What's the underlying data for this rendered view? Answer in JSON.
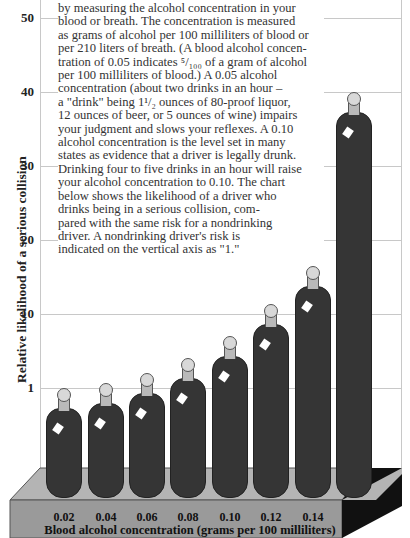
{
  "chart_data": {
    "type": "bar",
    "title": "",
    "xlabel": "Blood alcohol concentration (grams per 100 milliliters)",
    "ylabel": "Relative likelihood of a serious collision",
    "categories": [
      "0.02",
      "0.04",
      "0.06",
      "0.08",
      "0.10",
      "0.12",
      "0.14",
      "0.16"
    ],
    "values": [
      1,
      1.3,
      2,
      3,
      6,
      10,
      25,
      50
    ],
    "ytick_labels": [
      "1",
      "10",
      "20",
      "30",
      "40",
      "50"
    ],
    "grid": true,
    "marker_style": "wine bottles",
    "note": "Y-axis is non-linear; 1 = nondrinking driver's risk"
  },
  "text_block": {
    "lines": [
      "by measuring the alcohol concentration in your",
      "blood or breath. The concentration is measured",
      "as grams of alcohol per 100 milliliters of blood or",
      "per 210 liters of breath. (A blood alcohol concen-",
      "tration of 0.05 indicates ⁵/₁₀₀ of a gram of alcohol",
      "per 100 milliliters of blood.) A 0.05 alcohol",
      "concentration (about two drinks in an hour –",
      " a \"drink\" being 1¹/₂ ounces of 80-proof liquor,",
      "12 ounces of beer, or 5 ounces of wine) impairs",
      "your judgment and slows your reflexes. A 0.10",
      "alcohol concentration is the level set in many",
      "states as evidence that a driver is legally drunk.",
      "Drinking four to five drinks in an hour will raise",
      "your alcohol concentration to 0.10. The chart",
      "below shows the likelihood of a driver who",
      "drinks being in a serious collision, com-",
      "pared with the same risk for a nondrinking",
      "driver. A nondrinking driver's risk is",
      "indicated on the vertical axis as \"1.\""
    ]
  },
  "axis": {
    "yticks": [
      {
        "label": "50",
        "y": 18
      },
      {
        "label": "40",
        "y": 92
      },
      {
        "label": "30",
        "y": 166
      },
      {
        "label": "20",
        "y": 240
      },
      {
        "label": "10",
        "y": 314
      },
      {
        "label": "1",
        "y": 388
      }
    ]
  },
  "bottles": [
    {
      "label": "0.02",
      "x": 46,
      "top": 388
    },
    {
      "label": "0.04",
      "x": 88,
      "top": 383
    },
    {
      "label": "0.06",
      "x": 129,
      "top": 373
    },
    {
      "label": "0.08",
      "x": 170,
      "top": 358
    },
    {
      "label": "0.10",
      "x": 212,
      "top": 336
    },
    {
      "label": "0.12",
      "x": 253,
      "top": 304
    },
    {
      "label": "0.14",
      "x": 295,
      "top": 266
    },
    {
      "label": "0.16",
      "x": 336,
      "top": 92
    }
  ],
  "colors": {
    "bottle": "#353535",
    "cap": "#d8d8d8",
    "neck": "#b9b9b9",
    "platform_top": "#b4b4b4",
    "platform_front": "#9a9a9a",
    "platform_side": "#111111",
    "grid": "#c8c8c8"
  }
}
